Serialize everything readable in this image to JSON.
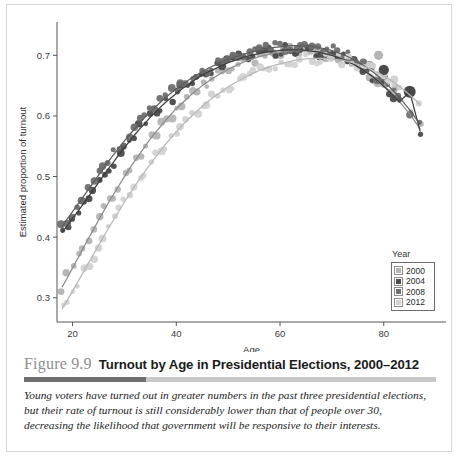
{
  "figure": {
    "number": "Figure 9.9",
    "title": "Turnout by Age in Presidential Elections, 2000–2012",
    "caption": "Young voters have turned out in greater numbers in the past three presidential elections, but their rate of turnout is still considerably lower than that of people over 30, decreasing the likelihood that government will be responsive to their interests."
  },
  "legend": {
    "title": "Year",
    "items": [
      {
        "label": "2000",
        "color": "#b4b4b4"
      },
      {
        "label": "2004",
        "color": "#4a4a4a"
      },
      {
        "label": "2008",
        "color": "#6e6e6e"
      },
      {
        "label": "2012",
        "color": "#d2d2d2"
      }
    ]
  },
  "chart_data": {
    "type": "scatter",
    "title": "Turnout by Age in Presidential Elections, 2000–2012",
    "xlabel": "Age",
    "ylabel": "Estimated proportion of turnout",
    "xlim": [
      17,
      92
    ],
    "ylim": [
      0.26,
      0.755
    ],
    "xticks": [
      20,
      40,
      60,
      80
    ],
    "yticks": [
      0.3,
      0.4,
      0.5,
      0.6,
      0.7
    ],
    "ytick_labels": [
      "0.3",
      "0.4",
      "0.5",
      "0.6",
      "0.7"
    ],
    "xtick_labels": [
      "20",
      "40",
      "60",
      "80"
    ],
    "grid": false,
    "legend_position": "bottom-right",
    "legend_title": "Year",
    "series": [
      {
        "name": "2000",
        "color": "#b4b4b4",
        "x": [
          18,
          19,
          20,
          21,
          22,
          23,
          24,
          25,
          26,
          27,
          28,
          29,
          30,
          31,
          32,
          33,
          34,
          35,
          36,
          37,
          38,
          39,
          40,
          41,
          42,
          43,
          44,
          45,
          46,
          47,
          48,
          49,
          50,
          51,
          52,
          53,
          54,
          55,
          56,
          57,
          58,
          59,
          60,
          61,
          62,
          63,
          64,
          65,
          66,
          67,
          68,
          69,
          70,
          71,
          72,
          73,
          74,
          75,
          76,
          77,
          78,
          79,
          80,
          81,
          82,
          83,
          85,
          87
        ],
        "y": [
          0.318,
          0.333,
          0.349,
          0.365,
          0.381,
          0.397,
          0.412,
          0.428,
          0.443,
          0.458,
          0.472,
          0.486,
          0.5,
          0.513,
          0.526,
          0.538,
          0.55,
          0.562,
          0.573,
          0.583,
          0.593,
          0.603,
          0.612,
          0.62,
          0.628,
          0.636,
          0.643,
          0.65,
          0.656,
          0.662,
          0.667,
          0.672,
          0.677,
          0.681,
          0.685,
          0.689,
          0.692,
          0.695,
          0.698,
          0.7,
          0.702,
          0.704,
          0.705,
          0.706,
          0.707,
          0.708,
          0.708,
          0.708,
          0.707,
          0.706,
          0.705,
          0.703,
          0.701,
          0.698,
          0.695,
          0.691,
          0.687,
          0.682,
          0.677,
          0.671,
          0.665,
          0.658,
          0.65,
          0.642,
          0.633,
          0.624,
          0.603,
          0.579
        ],
        "marker": "circle"
      },
      {
        "name": "2004",
        "color": "#4a4a4a",
        "x": [
          18,
          19,
          20,
          21,
          22,
          23,
          24,
          25,
          26,
          27,
          28,
          29,
          30,
          31,
          32,
          33,
          34,
          35,
          36,
          37,
          38,
          39,
          40,
          41,
          42,
          43,
          44,
          45,
          46,
          47,
          48,
          49,
          50,
          51,
          52,
          53,
          54,
          55,
          56,
          57,
          58,
          59,
          60,
          61,
          62,
          63,
          64,
          65,
          66,
          67,
          68,
          69,
          70,
          71,
          72,
          73,
          74,
          75,
          76,
          77,
          78,
          79,
          80,
          81,
          82,
          83,
          85,
          87
        ],
        "y": [
          0.408,
          0.419,
          0.431,
          0.442,
          0.454,
          0.466,
          0.478,
          0.49,
          0.502,
          0.514,
          0.525,
          0.537,
          0.548,
          0.558,
          0.569,
          0.579,
          0.588,
          0.598,
          0.606,
          0.615,
          0.623,
          0.63,
          0.637,
          0.644,
          0.65,
          0.656,
          0.662,
          0.667,
          0.672,
          0.676,
          0.68,
          0.684,
          0.688,
          0.691,
          0.694,
          0.697,
          0.699,
          0.701,
          0.703,
          0.705,
          0.706,
          0.707,
          0.708,
          0.709,
          0.709,
          0.709,
          0.709,
          0.708,
          0.707,
          0.706,
          0.704,
          0.702,
          0.7,
          0.697,
          0.694,
          0.69,
          0.686,
          0.681,
          0.676,
          0.67,
          0.664,
          0.657,
          0.649,
          0.641,
          0.632,
          0.623,
          0.64,
          0.575
        ],
        "marker": "circle"
      },
      {
        "name": "2008",
        "color": "#6e6e6e",
        "x": [
          18,
          19,
          20,
          21,
          22,
          23,
          24,
          25,
          26,
          27,
          28,
          29,
          30,
          31,
          32,
          33,
          34,
          35,
          36,
          37,
          38,
          39,
          40,
          41,
          42,
          43,
          44,
          45,
          46,
          47,
          48,
          49,
          50,
          51,
          52,
          53,
          54,
          55,
          56,
          57,
          58,
          59,
          60,
          61,
          62,
          63,
          64,
          65,
          66,
          67,
          68,
          69,
          70,
          71,
          72,
          73,
          74,
          75,
          76,
          77,
          78,
          79,
          80,
          81,
          82,
          83,
          85,
          87
        ],
        "y": [
          0.418,
          0.43,
          0.442,
          0.454,
          0.466,
          0.478,
          0.49,
          0.502,
          0.514,
          0.526,
          0.537,
          0.548,
          0.559,
          0.569,
          0.579,
          0.589,
          0.598,
          0.607,
          0.615,
          0.623,
          0.631,
          0.638,
          0.645,
          0.651,
          0.657,
          0.663,
          0.668,
          0.673,
          0.678,
          0.682,
          0.686,
          0.69,
          0.693,
          0.696,
          0.699,
          0.702,
          0.704,
          0.706,
          0.708,
          0.71,
          0.712,
          0.713,
          0.714,
          0.715,
          0.716,
          0.716,
          0.716,
          0.716,
          0.715,
          0.714,
          0.712,
          0.71,
          0.708,
          0.705,
          0.702,
          0.698,
          0.694,
          0.689,
          0.684,
          0.678,
          0.672,
          0.665,
          0.657,
          0.649,
          0.64,
          0.631,
          0.61,
          0.586
        ],
        "marker": "circle"
      },
      {
        "name": "2012",
        "color": "#d2d2d2",
        "x": [
          18,
          19,
          20,
          21,
          22,
          23,
          24,
          25,
          26,
          27,
          28,
          29,
          30,
          31,
          32,
          33,
          34,
          35,
          36,
          37,
          38,
          39,
          40,
          41,
          42,
          43,
          44,
          45,
          46,
          47,
          48,
          49,
          50,
          51,
          52,
          53,
          54,
          55,
          56,
          57,
          58,
          59,
          60,
          61,
          62,
          63,
          64,
          65,
          66,
          67,
          68,
          69,
          70,
          71,
          72,
          73,
          74,
          75,
          76,
          77,
          78,
          79,
          80,
          81,
          82,
          83,
          85,
          87
        ],
        "y": [
          0.282,
          0.296,
          0.311,
          0.326,
          0.341,
          0.356,
          0.371,
          0.386,
          0.401,
          0.416,
          0.43,
          0.444,
          0.458,
          0.471,
          0.484,
          0.497,
          0.509,
          0.521,
          0.532,
          0.543,
          0.554,
          0.564,
          0.574,
          0.583,
          0.592,
          0.6,
          0.608,
          0.616,
          0.623,
          0.63,
          0.636,
          0.642,
          0.648,
          0.653,
          0.658,
          0.663,
          0.667,
          0.671,
          0.675,
          0.678,
          0.681,
          0.684,
          0.686,
          0.688,
          0.69,
          0.692,
          0.693,
          0.694,
          0.695,
          0.695,
          0.695,
          0.695,
          0.694,
          0.693,
          0.692,
          0.69,
          0.688,
          0.685,
          0.682,
          0.679,
          0.675,
          0.671,
          0.666,
          0.661,
          0.655,
          0.649,
          0.635,
          0.619
        ],
        "marker": "circle"
      }
    ],
    "fit_lines": [
      {
        "name": "2000",
        "color": "#8c8c8c"
      },
      {
        "name": "2004",
        "color": "#3c3c3c"
      },
      {
        "name": "2008",
        "color": "#5e5e5e"
      },
      {
        "name": "2012",
        "color": "#b8b8b8"
      }
    ]
  }
}
